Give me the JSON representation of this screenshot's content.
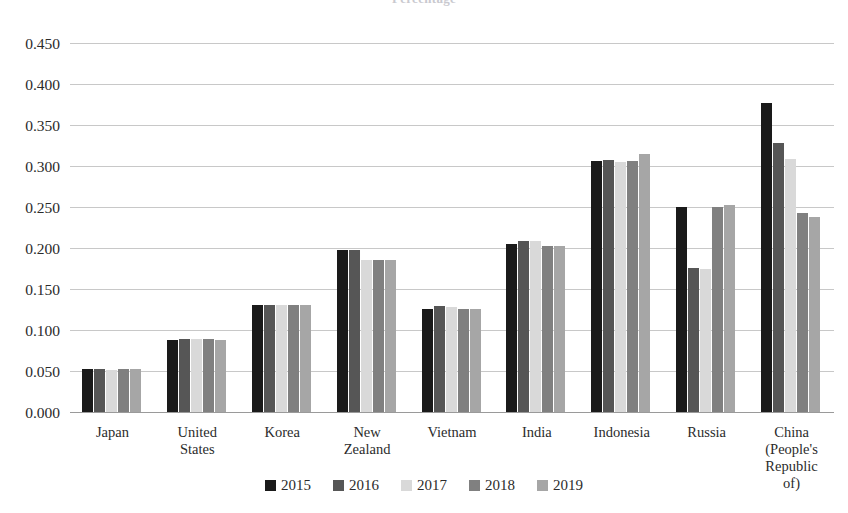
{
  "chart_data": {
    "type": "bar",
    "title": "Percentage",
    "xlabel": "",
    "ylabel": "",
    "ylim": [
      0.0,
      0.45
    ],
    "ytick_step": 0.05,
    "ytick_labels": [
      "0.450",
      "0.400",
      "0.350",
      "0.300",
      "0.250",
      "0.200",
      "0.150",
      "0.100",
      "0.050",
      "0.000"
    ],
    "ytick_values": [
      0.45,
      0.4,
      0.35,
      0.3,
      0.25,
      0.2,
      0.15,
      0.1,
      0.05,
      0.0
    ],
    "grid": true,
    "legend_position": "bottom",
    "categories": [
      "Japan",
      "United States",
      "Korea",
      "New Zealand",
      "Vietnam",
      "India",
      "Indonesia",
      "Russia",
      "China (People's Republic of)"
    ],
    "category_lines": [
      [
        "Japan"
      ],
      [
        "United",
        "States"
      ],
      [
        "Korea"
      ],
      [
        "New",
        "Zealand"
      ],
      [
        "Vietnam"
      ],
      [
        "India"
      ],
      [
        "Indonesia"
      ],
      [
        "Russia"
      ],
      [
        "China",
        "(People's",
        "Republic",
        "of)"
      ]
    ],
    "series": [
      {
        "name": "2015",
        "color": "#1a1a1a",
        "values": [
          0.052,
          0.088,
          0.131,
          0.198,
          0.126,
          0.205,
          0.306,
          0.25,
          0.377
        ]
      },
      {
        "name": "2016",
        "color": "#565656",
        "values": [
          0.052,
          0.089,
          0.131,
          0.198,
          0.129,
          0.209,
          0.307,
          0.176,
          0.328
        ]
      },
      {
        "name": "2017",
        "color": "#d9d9d9",
        "values": [
          0.051,
          0.089,
          0.131,
          0.185,
          0.128,
          0.208,
          0.305,
          0.175,
          0.309
        ]
      },
      {
        "name": "2018",
        "color": "#808080",
        "values": [
          0.052,
          0.089,
          0.131,
          0.185,
          0.126,
          0.203,
          0.306,
          0.25,
          0.243
        ]
      },
      {
        "name": "2019",
        "color": "#a6a6a6",
        "values": [
          0.052,
          0.088,
          0.131,
          0.185,
          0.126,
          0.202,
          0.315,
          0.253,
          0.238
        ]
      }
    ]
  },
  "axis": {
    "y_color": "#2b2b2b",
    "gridline_color": "#c8c8c8",
    "baseline_color": "#9a9a9a"
  }
}
